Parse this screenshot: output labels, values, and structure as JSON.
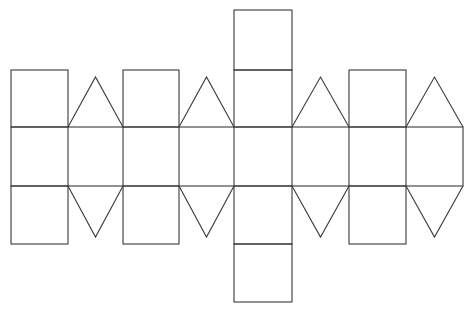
{
  "diagram": {
    "type": "polyhedron-net",
    "stroke_color": "#3a3a3a",
    "background": "#ffffff",
    "columns_x": [
      11,
      68,
      123,
      179,
      234,
      292,
      349,
      406,
      463
    ],
    "rows_y": {
      "top_square_top": 10,
      "upper_row_top": 70,
      "band_top": 127,
      "band_bottom": 186,
      "lower_row_bottom": 244,
      "bottom_square_bottom": 302
    },
    "triangle_apex_y": {
      "upper": 77,
      "lower": 237
    },
    "shapes": {
      "squares": [
        {
          "name": "upper-square-1",
          "x": 11,
          "y": 70,
          "w": 57,
          "h": 57
        },
        {
          "name": "upper-square-2",
          "x": 123,
          "y": 70,
          "w": 56,
          "h": 57
        },
        {
          "name": "center-top-square",
          "x": 234,
          "y": 10,
          "w": 58,
          "h": 60
        },
        {
          "name": "center-upper-square",
          "x": 234,
          "y": 70,
          "w": 58,
          "h": 57
        },
        {
          "name": "upper-square-3",
          "x": 349,
          "y": 70,
          "w": 57,
          "h": 57
        },
        {
          "name": "lower-square-1",
          "x": 11,
          "y": 186,
          "w": 57,
          "h": 58
        },
        {
          "name": "lower-square-2",
          "x": 123,
          "y": 186,
          "w": 56,
          "h": 58
        },
        {
          "name": "center-lower-square",
          "x": 234,
          "y": 186,
          "w": 58,
          "h": 58
        },
        {
          "name": "center-bottom-square",
          "x": 234,
          "y": 244,
          "w": 58,
          "h": 58
        },
        {
          "name": "lower-square-3",
          "x": 349,
          "y": 186,
          "w": 57,
          "h": 58
        }
      ],
      "triangles": [
        {
          "name": "upper-triangle-1",
          "points": "68,127 95.5,77 123,127"
        },
        {
          "name": "upper-triangle-2",
          "points": "179,127 206.5,77 234,127"
        },
        {
          "name": "upper-triangle-3",
          "points": "292,127 320.5,77 349,127"
        },
        {
          "name": "upper-triangle-4",
          "points": "406,127 434.5,77 463,127"
        },
        {
          "name": "lower-triangle-1",
          "points": "68,186 95.5,237 123,186"
        },
        {
          "name": "lower-triangle-2",
          "points": "179,186 206.5,237 234,186"
        },
        {
          "name": "lower-triangle-3",
          "points": "292,186 320.5,237 349,186"
        },
        {
          "name": "lower-triangle-4",
          "points": "406,186 434.5,237 463,186"
        }
      ],
      "band": {
        "name": "middle-band",
        "x": 11,
        "y": 127,
        "w": 452,
        "h": 59
      }
    }
  }
}
